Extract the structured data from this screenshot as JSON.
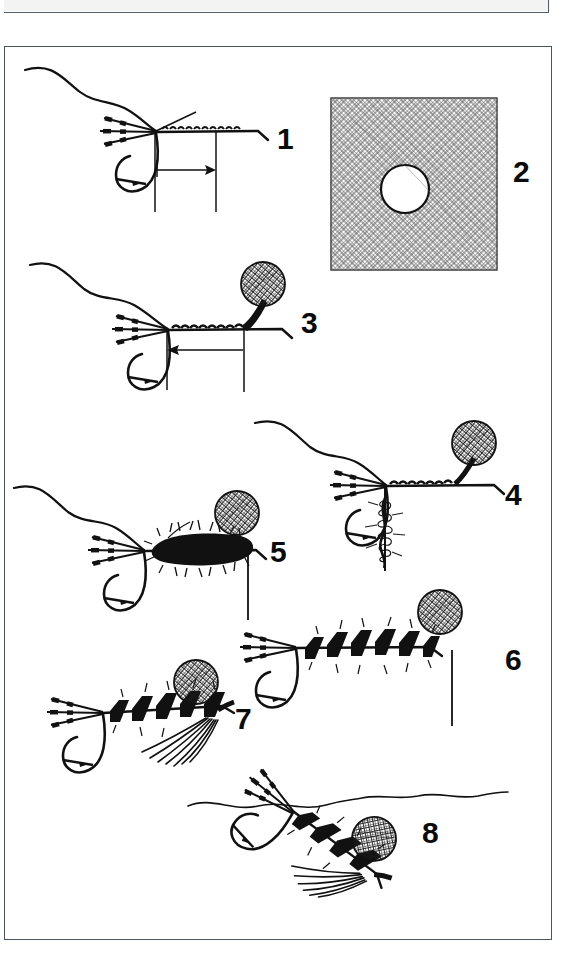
{
  "page": {
    "background_color": "#ffffff",
    "ink_color": "#111111",
    "border_color": "#4c555c",
    "width": 578,
    "height": 979
  },
  "plate": {
    "border_color": "#4c555c",
    "x": 4,
    "y": 46,
    "width": 548,
    "height": 894
  },
  "steps": [
    {
      "number": "1",
      "label_x": 277,
      "label_y": 124,
      "caption": "Hook in vise with tail fibers and ribbing wire tied in; arrow shows thread moving forward along the shank",
      "elements": [
        "hook",
        "thread-from-bobbin",
        "tail-fibers",
        "ribbing-wire",
        "direction-arrow-right",
        "tie-in-markers"
      ]
    },
    {
      "number": "2",
      "label_x": 513,
      "label_y": 157,
      "caption": "Square of mesh netting material with a punched hole",
      "elements": [
        "mesh-square",
        "punched-hole"
      ]
    },
    {
      "number": "3",
      "label_x": 301,
      "label_y": 308,
      "caption": "Mesh ball secured at the head; arrow shows thread wound back toward the bend",
      "elements": [
        "hook",
        "mesh-ball-head",
        "thread-wraps",
        "direction-arrow-left",
        "tie-in-markers"
      ]
    },
    {
      "number": "4",
      "label_x": 505,
      "label_y": 480,
      "caption": "Dubbing spun onto the hanging tying thread",
      "elements": [
        "hook",
        "mesh-ball-head",
        "dubbing-noodle",
        "hanging-thread"
      ]
    },
    {
      "number": "5",
      "label_x": 270,
      "label_y": 537,
      "caption": "Dubbing wound forward to form a shaggy body up to the head",
      "elements": [
        "hook",
        "mesh-ball-head",
        "dubbed-body",
        "hanging-thread"
      ]
    },
    {
      "number": "6",
      "label_x": 505,
      "label_y": 645,
      "caption": "Ribbing wire wound forward over the body in open segments",
      "elements": [
        "hook",
        "mesh-ball-head",
        "segmented-body",
        "rib-wraps",
        "hanging-thread"
      ]
    },
    {
      "number": "7",
      "label_x": 235,
      "label_y": 704,
      "caption": "Throat hackle / legs added beneath the thorax, completing the fly",
      "elements": [
        "hook",
        "mesh-ball-head",
        "segmented-body",
        "throat-hackle"
      ]
    },
    {
      "number": "8",
      "label_x": 422,
      "label_y": 818,
      "caption": "Finished fly suspended in the surface film, head in the meniscus",
      "elements": [
        "water-surface-line",
        "hook",
        "mesh-ball-head",
        "segmented-body",
        "throat-hackle"
      ]
    }
  ]
}
